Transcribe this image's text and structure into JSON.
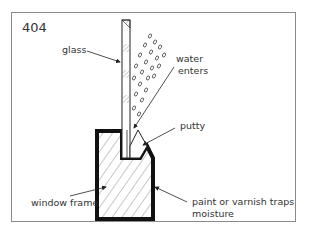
{
  "figure": {
    "number": "404",
    "labels": {
      "glass": "glass",
      "water_line1": "water",
      "water_line2": "enters",
      "putty": "putty",
      "window_frame": "window frame",
      "paint_line1": "paint or varnish traps",
      "paint_line2": "moisture"
    }
  },
  "colors": {
    "border": "#8a8a8a",
    "ink": "#222222",
    "text": "#333333"
  }
}
